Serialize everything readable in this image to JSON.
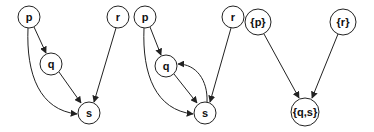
{
  "colors": {
    "stroke": "#222222",
    "background": "#ffffff"
  },
  "graphs": [
    {
      "nodes": [
        {
          "id": "p",
          "label": "p",
          "x": 29,
          "y": 17,
          "r": 11
        },
        {
          "id": "q",
          "label": "q",
          "x": 51,
          "y": 64,
          "r": 11
        },
        {
          "id": "r",
          "label": "r",
          "x": 118,
          "y": 17,
          "r": 11
        },
        {
          "id": "s",
          "label": "s",
          "x": 89,
          "y": 113,
          "r": 11
        }
      ],
      "edges": [
        {
          "from": "p",
          "to": "q"
        },
        {
          "from": "p",
          "to": "s",
          "curved": true
        },
        {
          "from": "q",
          "to": "s"
        },
        {
          "from": "r",
          "to": "s"
        }
      ]
    },
    {
      "nodes": [
        {
          "id": "p",
          "label": "p",
          "x": 145,
          "y": 17,
          "r": 11
        },
        {
          "id": "q",
          "label": "q",
          "x": 166,
          "y": 66,
          "r": 11
        },
        {
          "id": "r",
          "label": "r",
          "x": 233,
          "y": 17,
          "r": 11
        },
        {
          "id": "s",
          "label": "s",
          "x": 205,
          "y": 113,
          "r": 11
        }
      ],
      "edges": [
        {
          "from": "p",
          "to": "q"
        },
        {
          "from": "p",
          "to": "s",
          "curved": true
        },
        {
          "from": "q",
          "to": "s"
        },
        {
          "from": "s",
          "to": "q",
          "curved": true
        },
        {
          "from": "r",
          "to": "s"
        }
      ]
    },
    {
      "nodes": [
        {
          "id": "P",
          "label": "{p}",
          "x": 258,
          "y": 22,
          "r": 13
        },
        {
          "id": "R",
          "label": "{r}",
          "x": 343,
          "y": 22,
          "r": 13
        },
        {
          "id": "QS",
          "label": "{q,s}",
          "x": 305,
          "y": 112,
          "r": 14
        }
      ],
      "edges": [
        {
          "from": "P",
          "to": "QS"
        },
        {
          "from": "R",
          "to": "QS"
        }
      ]
    }
  ]
}
